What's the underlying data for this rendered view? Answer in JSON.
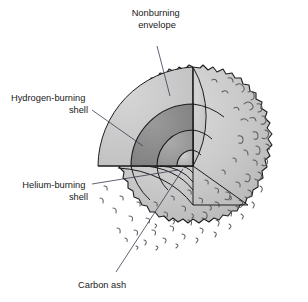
{
  "diagram": {
    "type": "cross-section-cutaway",
    "background": "#ffffff",
    "sphere": {
      "center_x": 193,
      "center_y": 167,
      "radius": 100,
      "rim_style": "jagged",
      "texture": "squiggle convection marks"
    },
    "cut": {
      "vertical_face_x": 193,
      "horizontal_face_y": 166,
      "quadrant_removed": "upper-right"
    },
    "layers": [
      {
        "id": "envelope",
        "name": "Nonburning envelope",
        "color": "#c9c9c9",
        "radius": 100
      },
      {
        "id": "hydrogen",
        "name": "Hydrogen-burning shell",
        "color": "#8c8c8c",
        "radius": 62
      },
      {
        "id": "helium",
        "name": "Helium-burning shell",
        "color": "#9e9e9e",
        "radius": 36
      },
      {
        "id": "carbon",
        "name": "Carbon ash",
        "color": "#bdbdbd",
        "radius": 16
      }
    ],
    "labels": [
      {
        "id": "nonburning-envelope",
        "lines": [
          "Nonburning",
          "envelope"
        ],
        "align": "middle",
        "x": 157,
        "y": 16
      },
      {
        "id": "hydrogen-shell",
        "lines": [
          "Hydrogen-burning",
          "shell"
        ],
        "align": "end",
        "x": 88,
        "y": 101
      },
      {
        "id": "helium-shell",
        "lines": [
          "Helium-burning",
          "shell"
        ],
        "align": "end",
        "x": 88,
        "y": 188
      },
      {
        "id": "carbon-ash",
        "lines": [
          "Carbon ash"
        ],
        "align": "start",
        "x": 78,
        "y": 288
      }
    ],
    "leaders": [
      {
        "id": "leader-envelope",
        "points": "157,46 170,96"
      },
      {
        "id": "leader-hydrogen",
        "points": "92,110 143,146"
      },
      {
        "id": "leader-helium",
        "points": "92,184 178,170"
      },
      {
        "id": "leader-carbon",
        "points": "116,272 183,169"
      }
    ]
  }
}
